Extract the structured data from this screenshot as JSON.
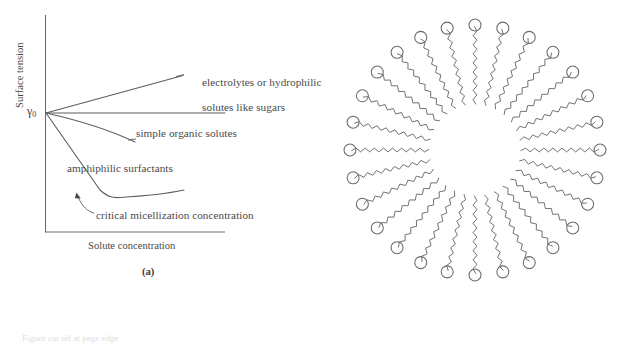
{
  "figure": {
    "panels": [
      {
        "id": "a",
        "caption": "(a)",
        "x_axis_title": "Solute concentration",
        "y_axis_title": "Surface tension",
        "origin_symbol": "γ",
        "origin_subscript": "0",
        "labels": {
          "electrolytes_line1": "electrolytes or hydrophilic",
          "electrolytes_line2": "solutes like sugars",
          "simple_organic": "simple organic solutes",
          "amphiphilic": "amphiphilic surfactants",
          "cmc": "critical micellization concentration"
        }
      },
      {
        "id": "b",
        "caption": "(b)",
        "description": "micelle cross-section",
        "surfactant_count": 28,
        "head_label": "hydrophilic head group",
        "tail_label": "hydrophobic tail"
      }
    ],
    "bottom_bleed_text": "Figure cut off at page edge"
  },
  "chart_data": {
    "type": "line",
    "title": "",
    "xlabel": "Solute concentration",
    "ylabel": "Surface tension",
    "xlim": [
      0,
      100
    ],
    "ylim": [
      0,
      100
    ],
    "grid": false,
    "legend": "inline annotations",
    "axis_note": "Unlabeled qualitative axes; gamma-zero marks the surface tension of pure solvent at zero concentration.",
    "origin_marker": "γ0",
    "series": [
      {
        "name": "electrolytes or hydrophilic solutes like sugars",
        "trend": "slight increase",
        "points": [
          [
            0,
            63
          ],
          [
            76,
            79
          ]
        ]
      },
      {
        "name": "pure solvent baseline",
        "trend": "flat",
        "points": [
          [
            0,
            63
          ],
          [
            100,
            63
          ]
        ]
      },
      {
        "name": "simple organic solutes",
        "trend": "gentle decrease",
        "points": [
          [
            0,
            63
          ],
          [
            30,
            54
          ],
          [
            60,
            46
          ]
        ]
      },
      {
        "name": "amphiphilic surfactants",
        "trend": "steep decrease then plateau above the CMC",
        "points": [
          [
            0,
            63
          ],
          [
            13,
            40
          ],
          [
            25,
            17
          ],
          [
            32,
            14
          ],
          [
            50,
            13
          ],
          [
            70,
            13.5
          ],
          [
            88,
            14.5
          ]
        ]
      }
    ],
    "annotations": [
      {
        "text": "electrolytes or hydrophilic solutes like sugars",
        "at": [
          76,
          79
        ]
      },
      {
        "text": "simple organic solutes",
        "at": [
          60,
          46
        ]
      },
      {
        "text": "amphiphilic surfactants",
        "at": [
          25,
          33
        ]
      },
      {
        "text": "critical micellization concentration",
        "at": [
          25,
          15
        ],
        "arrow": true
      }
    ]
  }
}
